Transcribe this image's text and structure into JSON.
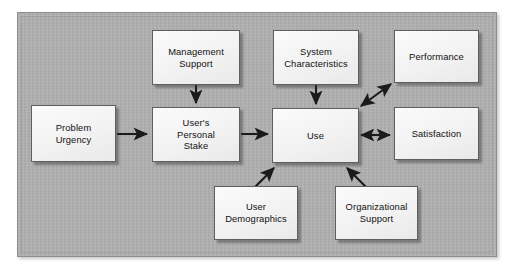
{
  "diagram": {
    "background_color": "#b0b0b0",
    "frame_border_color": "#8e8e8e",
    "node_fill_color": "#f4f4f4",
    "node_border_color": "#5f5f5f",
    "arrow_color": "#1a1a1a",
    "nodes": [
      {
        "id": "problem_urgency",
        "label": "Problem\nUrgency",
        "x": 31,
        "y": 105,
        "w": 85,
        "h": 57
      },
      {
        "id": "management_support",
        "label": "Management\nSupport",
        "x": 152,
        "y": 30,
        "w": 88,
        "h": 55
      },
      {
        "id": "users_personal_stake",
        "label": "User's\nPersonal\nStake",
        "x": 152,
        "y": 107,
        "w": 88,
        "h": 55
      },
      {
        "id": "system_characteristics",
        "label": "System\nCharacteristics",
        "x": 273,
        "y": 30,
        "w": 86,
        "h": 55
      },
      {
        "id": "use",
        "label": "Use",
        "x": 272,
        "y": 108,
        "w": 87,
        "h": 55
      },
      {
        "id": "performance",
        "label": "Performance",
        "x": 394,
        "y": 30,
        "w": 85,
        "h": 53
      },
      {
        "id": "satisfaction",
        "label": "Satisfaction",
        "x": 394,
        "y": 107,
        "w": 85,
        "h": 53
      },
      {
        "id": "user_demographics",
        "label": "User\nDemographics",
        "x": 214,
        "y": 186,
        "w": 84,
        "h": 54
      },
      {
        "id": "organizational_support",
        "label": "Organizational\nSupport",
        "x": 335,
        "y": 186,
        "w": 83,
        "h": 54
      }
    ],
    "edges": [
      {
        "id": "e_problem_to_stake",
        "from": "problem_urgency",
        "to": "users_personal_stake",
        "kind": "single",
        "direction": "right"
      },
      {
        "id": "e_mgmt_to_stake",
        "from": "management_support",
        "to": "users_personal_stake",
        "kind": "single",
        "direction": "down"
      },
      {
        "id": "e_stake_to_use",
        "from": "users_personal_stake",
        "to": "use",
        "kind": "single",
        "direction": "right"
      },
      {
        "id": "e_syschar_to_use",
        "from": "system_characteristics",
        "to": "use",
        "kind": "single",
        "direction": "down"
      },
      {
        "id": "e_demog_to_use",
        "from": "user_demographics",
        "to": "use",
        "kind": "single",
        "direction": "up-right"
      },
      {
        "id": "e_orgsup_to_use",
        "from": "organizational_support",
        "to": "use",
        "kind": "single",
        "direction": "up-left"
      },
      {
        "id": "e_use_performance",
        "from": "use",
        "to": "performance",
        "kind": "double",
        "direction": "diagonal-up-right"
      },
      {
        "id": "e_use_satisfaction",
        "from": "use",
        "to": "satisfaction",
        "kind": "double",
        "direction": "horizontal"
      }
    ]
  }
}
